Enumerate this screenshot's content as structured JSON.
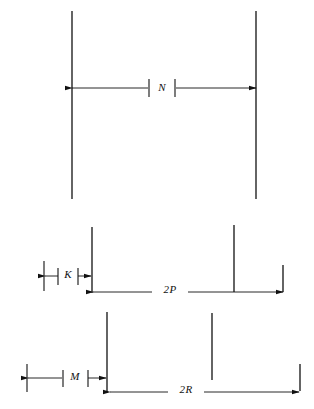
{
  "figure": {
    "type": "engineering-dimension-diagram",
    "background_color": "#ffffff",
    "line_color": "#111111",
    "width": 314,
    "height": 409,
    "sections": [
      {
        "id": "top",
        "name": "overall-width-section",
        "dimension_label": "N",
        "extension_lines": [
          {
            "name": "left-extension-line",
            "x": 72,
            "y1": 11,
            "y2": 199
          },
          {
            "name": "right-extension-line",
            "x": 256,
            "y1": 11,
            "y2": 199
          }
        ],
        "dimension_line": {
          "name": "n-dimension-line",
          "y": 88,
          "x1": 72,
          "x2": 256,
          "arrow_left": true,
          "arrow_right": true,
          "gap_x1": 148,
          "gap_x2": 176,
          "label_x": 162,
          "label_y": 88,
          "tick_left_x": 148,
          "tick_right_x": 176,
          "tick_y1": 80,
          "tick_y2": 96
        }
      },
      {
        "id": "middle",
        "name": "k-and-2p-section",
        "dimension_labels": [
          "K",
          "2P"
        ],
        "extension_lines": [
          {
            "name": "k-left-extension-line",
            "x": 44,
            "y1": 261,
            "y2": 291
          },
          {
            "name": "k-right-extension-line",
            "x": 92,
            "y1": 227,
            "y2": 293
          },
          {
            "name": "middle-extension-line",
            "x": 234,
            "y1": 225,
            "y2": 292
          },
          {
            "name": "right-extension-line",
            "x": 283,
            "y1": 265,
            "y2": 292
          }
        ],
        "k_dimension_line": {
          "name": "k-dimension-line",
          "y": 276,
          "x1": 44,
          "x2": 92,
          "arrow_left": true,
          "arrow_right": true,
          "label_x": 68,
          "label_y": 275,
          "tick_left_x": 58,
          "tick_right_x": 78,
          "tick_y1": 268,
          "tick_y2": 284
        },
        "p_dimension_line": {
          "name": "two-p-dimension-line",
          "y": 292,
          "x1": 93,
          "x2": 283,
          "arrow_left": true,
          "arrow_right": true,
          "gap_x1": 152,
          "gap_x2": 188,
          "label_x": 170,
          "label_y": 290
        }
      },
      {
        "id": "bottom",
        "name": "m-and-2r-section",
        "dimension_labels": [
          "M",
          "2R"
        ],
        "extension_lines": [
          {
            "name": "m-left-extension-line",
            "x": 27,
            "y1": 364,
            "y2": 392
          },
          {
            "name": "m-right-extension-line",
            "x": 107,
            "y1": 312,
            "y2": 393
          },
          {
            "name": "middle-extension-line",
            "x": 212,
            "y1": 313,
            "y2": 380
          },
          {
            "name": "right-extension-line",
            "x": 300,
            "y1": 364,
            "y2": 392
          }
        ],
        "m_dimension_line": {
          "name": "m-dimension-line",
          "y": 378,
          "x1": 27,
          "x2": 107,
          "arrow_left": true,
          "arrow_right": true,
          "gap_x1": 62,
          "gap_x2": 88,
          "label_x": 75,
          "label_y": 377,
          "tick_left_x": 62,
          "tick_right_x": 88,
          "tick_y1": 370,
          "tick_y2": 386
        },
        "r_dimension_line": {
          "name": "two-r-dimension-line",
          "y": 392,
          "x1": 110,
          "x2": 300,
          "arrow_left": true,
          "arrow_right": true,
          "gap_x1": 168,
          "gap_x2": 204,
          "label_x": 186,
          "label_y": 390
        }
      }
    ],
    "labels": {
      "n": "N",
      "k": "K",
      "two_p": "2P",
      "m": "M",
      "two_r": "2R"
    }
  }
}
